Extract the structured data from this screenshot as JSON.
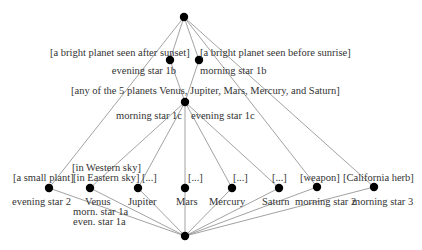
{
  "diagram": {
    "nodes": {
      "top": {
        "x": 184,
        "y": 17
      },
      "evening_star_1b": {
        "x": 170,
        "y": 60
      },
      "morning_star_1b": {
        "x": 199,
        "y": 60
      },
      "middle": {
        "x": 185,
        "y": 102
      },
      "evening_star_2": {
        "x": 49,
        "y": 188
      },
      "venus": {
        "x": 90,
        "y": 188
      },
      "jupiter": {
        "x": 138,
        "y": 188
      },
      "mars": {
        "x": 185,
        "y": 188
      },
      "mercury": {
        "x": 232,
        "y": 188
      },
      "saturn": {
        "x": 279,
        "y": 188
      },
      "morning_star_2": {
        "x": 317,
        "y": 187
      },
      "morning_star_3": {
        "x": 374,
        "y": 187
      },
      "bottom": {
        "x": 185,
        "y": 236
      }
    },
    "edges": [
      [
        "top",
        "evening_star_2"
      ],
      [
        "top",
        "evening_star_1b"
      ],
      [
        "top",
        "morning_star_1b"
      ],
      [
        "top",
        "morning_star_2"
      ],
      [
        "top",
        "morning_star_3"
      ],
      [
        "evening_star_1b",
        "middle"
      ],
      [
        "morning_star_1b",
        "middle"
      ],
      [
        "middle",
        "venus"
      ],
      [
        "middle",
        "jupiter"
      ],
      [
        "middle",
        "mars"
      ],
      [
        "middle",
        "mercury"
      ],
      [
        "middle",
        "saturn"
      ],
      [
        "evening_star_2",
        "bottom"
      ],
      [
        "venus",
        "bottom"
      ],
      [
        "jupiter",
        "bottom"
      ],
      [
        "mars",
        "bottom"
      ],
      [
        "mercury",
        "bottom"
      ],
      [
        "saturn",
        "bottom"
      ],
      [
        "morning_star_2",
        "bottom"
      ],
      [
        "morning_star_3",
        "bottom"
      ]
    ],
    "colors": {
      "node": "#000000",
      "edge": "#8a8a8a",
      "text": "#333333"
    }
  },
  "labels": {
    "bright_after_sunset": "[a bright planet seen after sunset]",
    "evening_star_1b": "evening star 1b",
    "bright_before_sunrise": "[a bright planet seen before sunrise]",
    "morning_star_1b": "morning star 1b",
    "any_of_5": "[any of the 5 planets Venus, Jupiter, Mars, Mercury, and Saturn]",
    "morning_star_1c": "morning star 1c",
    "evening_star_1c": "evening star 1c",
    "small_plant": "[a small plant]",
    "in_western_sky": "[in Western sky]",
    "in_eastern_sky": "[in Eastern sky]",
    "jupiter_gloss": "[...]",
    "mars_gloss": "[...]",
    "mercury_gloss": "[...]",
    "saturn_gloss": "[...]",
    "weapon": "[weapon]",
    "california_herb": "[California herb]",
    "evening_star_2": "evening star 2",
    "venus": "Venus",
    "morn_star_1a": "morn. star 1a",
    "even_star_1a": "even. star 1a",
    "jupiter": "Jupiter",
    "mars": "Mars",
    "mercury": "Mercury",
    "saturn": "Saturn",
    "morning_star_2": "morning star 2",
    "morning_star_3": "morning star 3"
  }
}
